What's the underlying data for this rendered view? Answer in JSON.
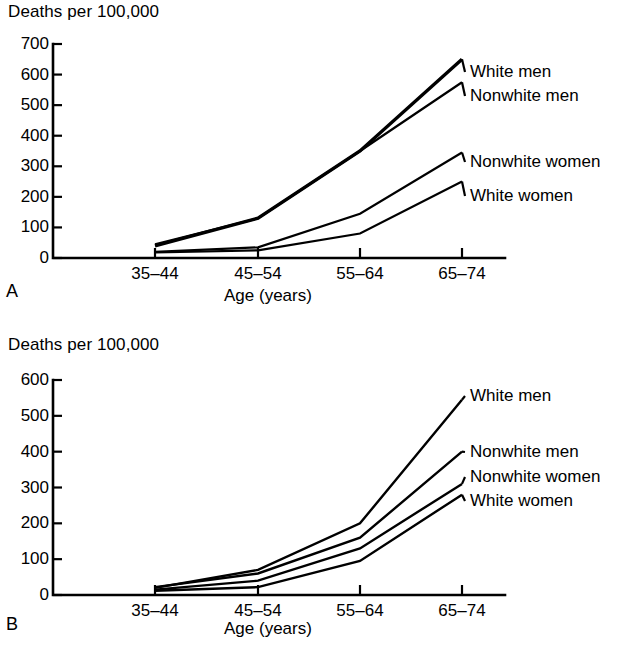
{
  "figure": {
    "panels": [
      {
        "letter": "A",
        "y_axis_title": "Deaths per 100,000",
        "x_axis_title": "Age (years)"
      },
      {
        "letter": "B",
        "y_axis_title": "Deaths per 100,000",
        "x_axis_title": "Age (years)"
      }
    ]
  },
  "chart_data": [
    {
      "type": "line",
      "panel": "A",
      "title": "",
      "xlabel": "Age (years)",
      "ylabel": "Deaths per 100,000",
      "categories": [
        "35–44",
        "45–54",
        "55–64",
        "65–74"
      ],
      "yticks": [
        0,
        100,
        200,
        300,
        400,
        500,
        600,
        700
      ],
      "ylim": [
        0,
        700
      ],
      "grid": false,
      "legend_position": "right-inline",
      "series": [
        {
          "name": "White men",
          "values": [
            40,
            130,
            350,
            650
          ],
          "line_width": 3.4,
          "label_y": 62
        },
        {
          "name": "Nonwhite men",
          "values": [
            45,
            130,
            350,
            575
          ],
          "line_width": 2.2,
          "label_y": 86
        },
        {
          "name": "Nonwhite women",
          "values": [
            20,
            35,
            145,
            345
          ],
          "line_width": 2.2,
          "label_y": 152
        },
        {
          "name": "White women",
          "values": [
            18,
            25,
            80,
            250
          ],
          "line_width": 2.2,
          "label_y": 186
        }
      ]
    },
    {
      "type": "line",
      "panel": "B",
      "title": "",
      "xlabel": "Age (years)",
      "ylabel": "Deaths per 100,000",
      "categories": [
        "35–44",
        "45–54",
        "55–64",
        "65–74"
      ],
      "yticks": [
        0,
        100,
        200,
        300,
        400,
        500,
        600
      ],
      "ylim": [
        0,
        600
      ],
      "grid": false,
      "legend_position": "right-inline",
      "series": [
        {
          "name": "White men",
          "values": [
            20,
            70,
            200,
            545
          ],
          "line_width": 2.4,
          "label_y": 64
        },
        {
          "name": "Nonwhite men",
          "values": [
            22,
            60,
            160,
            400
          ],
          "line_width": 2.4,
          "label_y": 120
        },
        {
          "name": "Nonwhite women",
          "values": [
            15,
            40,
            130,
            310
          ],
          "line_width": 2.4,
          "label_y": 145
        },
        {
          "name": "White women",
          "values": [
            12,
            22,
            95,
            280
          ],
          "line_width": 2.4,
          "label_y": 169
        }
      ]
    }
  ]
}
